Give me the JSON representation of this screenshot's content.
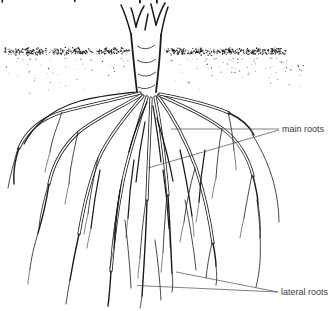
{
  "diagram": {
    "labels": {
      "main_roots": "main roots",
      "lateral_roots": "lateral roots"
    },
    "colors": {
      "background": "#ffffff",
      "ink": "#1a1a1a",
      "label_text": "#3a3a3a",
      "leader_line": "#4a4a4a"
    }
  }
}
